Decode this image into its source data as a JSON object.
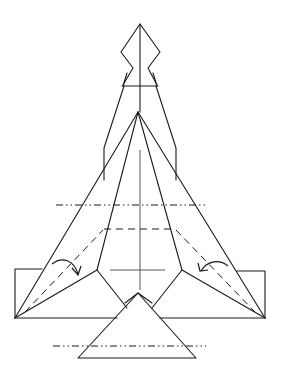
{
  "diagram": {
    "title": "",
    "colors": {
      "line": "#1a1a1a",
      "background": "#ffffff"
    },
    "symbols": [
      {
        "name": "valley-fold-line",
        "style": "dashed"
      },
      {
        "name": "mountain-fold-line",
        "style": "dash-dot-dot"
      },
      {
        "name": "fold-arrow-left",
        "direction": "clockwise"
      },
      {
        "name": "fold-arrow-right",
        "direction": "counter-clockwise"
      }
    ]
  }
}
